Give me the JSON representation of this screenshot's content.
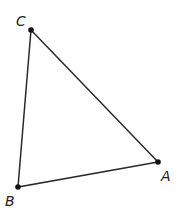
{
  "diagram": {
    "type": "triangle",
    "vertices": [
      {
        "label": "A",
        "x": 158,
        "y": 162
      },
      {
        "label": "B",
        "x": 18,
        "y": 187
      },
      {
        "label": "C",
        "x": 31,
        "y": 30
      }
    ],
    "edges": [
      [
        "C",
        "A"
      ],
      [
        "A",
        "B"
      ],
      [
        "B",
        "C"
      ]
    ],
    "line_color": "#2a2a2a"
  },
  "labels": {
    "A": "A",
    "B": "B",
    "C": "C"
  }
}
